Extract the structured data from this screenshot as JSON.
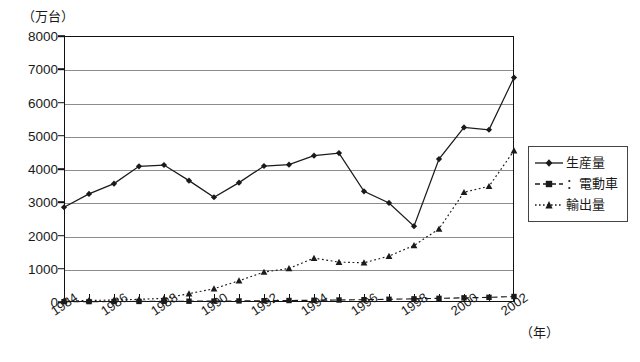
{
  "chart_data": {
    "type": "line",
    "title": "",
    "unit_label": "（万台）",
    "xlabel": "（年）",
    "ylabel": "",
    "x": [
      1984,
      1985,
      1986,
      1987,
      1988,
      1989,
      1990,
      1991,
      1992,
      1993,
      1994,
      1995,
      1996,
      1997,
      1998,
      1999,
      2000,
      2001,
      2002
    ],
    "xtick_labels": [
      "1984",
      "1986",
      "1988",
      "1990",
      "1992",
      "1994",
      "1996",
      "1998",
      "2000",
      "2002"
    ],
    "xtick_years": [
      1984,
      1986,
      1988,
      1990,
      1992,
      1994,
      1996,
      1998,
      2000,
      2002
    ],
    "ytick_labels": [
      "0",
      "1000",
      "2000",
      "3000",
      "4000",
      "5000",
      "6000",
      "7000",
      "8000"
    ],
    "ytick_values": [
      0,
      1000,
      2000,
      3000,
      4000,
      5000,
      6000,
      7000,
      8000
    ],
    "ylim": [
      0,
      8000
    ],
    "xlim": [
      1984,
      2002
    ],
    "grid": true,
    "legend_position": "right",
    "series": [
      {
        "name": "生産量",
        "marker": "diamond",
        "linestyle": "solid",
        "color": "#1a1a1a",
        "values": [
          2850,
          3250,
          3560,
          4080,
          4120,
          3650,
          3150,
          3590,
          4090,
          4130,
          4400,
          4480,
          3330,
          2980,
          2280,
          4300,
          5250,
          5180,
          6750
        ]
      },
      {
        "name": "：電動車",
        "marker": "square",
        "linestyle": "dashed",
        "color": "#1a1a1a",
        "values": [
          10,
          12,
          14,
          17,
          20,
          24,
          28,
          33,
          38,
          45,
          52,
          60,
          70,
          82,
          95,
          110,
          125,
          140,
          165
        ]
      },
      {
        "name": "輸出量",
        "marker": "triangle",
        "linestyle": "dotted",
        "color": "#1a1a1a",
        "values": [
          30,
          45,
          60,
          80,
          110,
          250,
          400,
          640,
          900,
          1010,
          1320,
          1200,
          1180,
          1380,
          1700,
          2200,
          3300,
          3480,
          4550
        ]
      }
    ]
  },
  "legend": {
    "items": [
      {
        "label": "生産量",
        "marker": "diamond",
        "linestyle": "solid"
      },
      {
        "label": "：電動車",
        "marker": "square",
        "linestyle": "dashed"
      },
      {
        "label": "輸出量",
        "marker": "triangle",
        "linestyle": "dotted"
      }
    ]
  }
}
